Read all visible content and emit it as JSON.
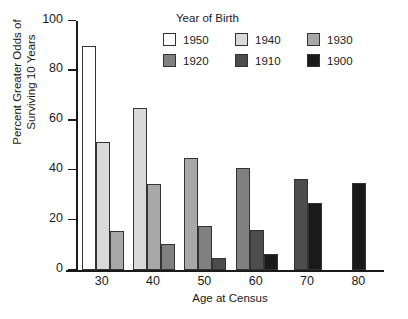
{
  "chart_data": {
    "type": "bar",
    "title": "",
    "xlabel": "Age at Census",
    "ylabel": "Percent Greater Odds of Surviving 10 Years",
    "ylabel_lines": [
      "Percent Greater Odds of",
      "Surviving 10 Years"
    ],
    "categories": [
      "30",
      "40",
      "50",
      "60",
      "70",
      "80"
    ],
    "ylim": [
      0,
      100
    ],
    "yticks": [
      0,
      20,
      40,
      60,
      80,
      100
    ],
    "ytick_labels": [
      "0",
      "20",
      "40",
      "60",
      "80",
      "100"
    ],
    "grid": false,
    "legend_title": "Year of Birth",
    "legend_position": "top-center-inside",
    "series": [
      {
        "name": "1950",
        "color": "#ffffff",
        "values": [
          90,
          null,
          null,
          null,
          null,
          null
        ]
      },
      {
        "name": "1940",
        "color": "#d9d9d9",
        "values": [
          51.5,
          65,
          null,
          null,
          null,
          null
        ]
      },
      {
        "name": "1930",
        "color": "#a8a8a8",
        "values": [
          15.5,
          34.5,
          45,
          null,
          null,
          null
        ]
      },
      {
        "name": "1920",
        "color": "#808080",
        "values": [
          null,
          10.5,
          17.5,
          41,
          null,
          null
        ]
      },
      {
        "name": "1910",
        "color": "#4d4d4d",
        "values": [
          null,
          null,
          5,
          16,
          36.5,
          null
        ]
      },
      {
        "name": "1900",
        "color": "#1a1a1a",
        "values": [
          null,
          null,
          null,
          6.5,
          27,
          35
        ]
      }
    ]
  },
  "legend": {
    "title": "Year of Birth",
    "items": [
      {
        "label": "1950",
        "color": "#ffffff"
      },
      {
        "label": "1940",
        "color": "#d9d9d9"
      },
      {
        "label": "1930",
        "color": "#a8a8a8"
      },
      {
        "label": "1920",
        "color": "#808080"
      },
      {
        "label": "1910",
        "color": "#4d4d4d"
      },
      {
        "label": "1900",
        "color": "#1a1a1a"
      }
    ]
  }
}
